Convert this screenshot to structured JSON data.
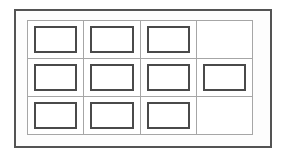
{
  "diagram": {
    "name": "panel-grid-diagram",
    "kind": "line-drawing",
    "frame": {
      "label": "outer-frame",
      "border_color": "#545454",
      "border_width_px": 2,
      "fill_color": "#ffffff"
    },
    "grid": {
      "columns": 4,
      "rows": 3,
      "line_color": "#a6a6a6",
      "line_width_px": 1,
      "fill_color": "#ffffff",
      "total_cells": 12,
      "filled_cells": 10,
      "empty_cells": 2
    },
    "panel_insert": {
      "border_color": "#4a4a4a",
      "border_width_px": 2,
      "fill_color": "#ffffff",
      "inset_x_px": 6,
      "inset_y_px": 5
    },
    "cells": [
      {
        "row": 1,
        "col": 1,
        "filled": true,
        "name": "cell-r1c1"
      },
      {
        "row": 1,
        "col": 2,
        "filled": true,
        "name": "cell-r1c2"
      },
      {
        "row": 1,
        "col": 3,
        "filled": true,
        "name": "cell-r1c3"
      },
      {
        "row": 1,
        "col": 4,
        "filled": false,
        "name": "cell-r1c4"
      },
      {
        "row": 2,
        "col": 1,
        "filled": true,
        "name": "cell-r2c1"
      },
      {
        "row": 2,
        "col": 2,
        "filled": true,
        "name": "cell-r2c2"
      },
      {
        "row": 2,
        "col": 3,
        "filled": true,
        "name": "cell-r2c3"
      },
      {
        "row": 2,
        "col": 4,
        "filled": true,
        "name": "cell-r2c4"
      },
      {
        "row": 3,
        "col": 1,
        "filled": true,
        "name": "cell-r3c1"
      },
      {
        "row": 3,
        "col": 2,
        "filled": true,
        "name": "cell-r3c2"
      },
      {
        "row": 3,
        "col": 3,
        "filled": true,
        "name": "cell-r3c3"
      },
      {
        "row": 3,
        "col": 4,
        "filled": false,
        "name": "cell-r3c4"
      }
    ]
  },
  "canvas": {
    "width_px": 287,
    "height_px": 157,
    "background_color": "#ffffff"
  }
}
